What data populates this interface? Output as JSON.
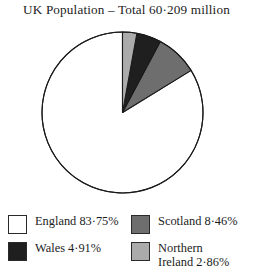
{
  "chart_data": {
    "type": "pie",
    "title": "UK Population – Total 60·209 million",
    "total_label": "60·209 million",
    "categories": [
      "England",
      "Scotland",
      "Wales",
      "Northern Ireland"
    ],
    "values": [
      83.75,
      8.46,
      4.91,
      2.86
    ],
    "value_labels": [
      "83·75%",
      "8·46%",
      "4·91%",
      "2·86%"
    ],
    "colors": [
      "#ffffff",
      "#6e6e6e",
      "#1f1f1f",
      "#ababab"
    ],
    "start_angle_deg": 90,
    "direction": "counterclockwise",
    "grid": false,
    "legend_position": "bottom",
    "xlabel": "",
    "ylabel": ""
  },
  "title": {
    "text": "UK Population – Total 60·209 million"
  },
  "legend": {
    "columns": [
      {
        "items": [
          {
            "label": "England 83·75%",
            "color": "#ffffff",
            "swatch_name": "legend-swatch-england"
          },
          {
            "label": "Wales 4·91%",
            "color": "#1f1f1f",
            "swatch_name": "legend-swatch-wales"
          }
        ]
      },
      {
        "items": [
          {
            "label": "Scotland 8·46%",
            "color": "#6e6e6e",
            "swatch_name": "legend-swatch-scotland"
          },
          {
            "label": "Northern\nIreland 2·86%",
            "color": "#ababab",
            "swatch_name": "legend-swatch-northern-ireland"
          }
        ]
      }
    ]
  },
  "pie": {
    "center_x": 81.5,
    "center_y": 81.5,
    "radius": 80.5,
    "stroke": "#1a1a1a",
    "stroke_width": 1.1
  }
}
